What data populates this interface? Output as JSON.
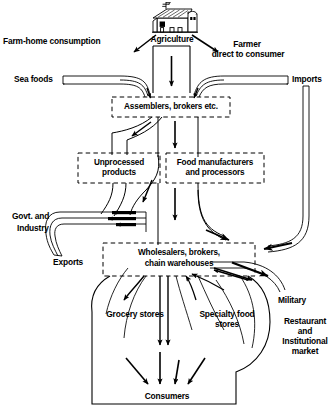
{
  "diagram": {
    "type": "flow-diagram",
    "nodes": {
      "agriculture": {
        "label": "Agriculture",
        "icon": "barn-icon"
      },
      "farm_home_consumption": {
        "label": "Farm-home consumption"
      },
      "farmer_direct_line1": {
        "label": "Farmer"
      },
      "farmer_direct_line2": {
        "label": "direct to consumer"
      },
      "sea_foods": {
        "label": "Sea foods"
      },
      "imports": {
        "label": "Imports"
      },
      "assemblers": {
        "label": "Assemblers, brokers etc."
      },
      "unprocessed_line1": {
        "label": "Unprocessed"
      },
      "unprocessed_line2": {
        "label": "products"
      },
      "manufacturers_line1": {
        "label": "Food manufacturers"
      },
      "manufacturers_line2": {
        "label": "and processors"
      },
      "govt_line1": {
        "label": "Govt. and"
      },
      "govt_line2": {
        "label": "Industry"
      },
      "exports": {
        "label": "Exports"
      },
      "wholesalers_line1": {
        "label": "Wholesalers, brokers,"
      },
      "wholesalers_line2": {
        "label": "chain warehouses"
      },
      "grocery_stores": {
        "label": "Grocery stores"
      },
      "specialty_line1": {
        "label": "Specialty food"
      },
      "specialty_line2": {
        "label": "stores"
      },
      "military": {
        "label": "Military"
      },
      "restaurant_line1": {
        "label": "Restaurant"
      },
      "restaurant_line2": {
        "label": "and"
      },
      "restaurant_line3": {
        "label": "Institutional"
      },
      "restaurant_line4": {
        "label": "market"
      },
      "consumers": {
        "label": "Consumers"
      }
    },
    "colors": {
      "ink": "#000000",
      "background": "#ffffff"
    }
  }
}
